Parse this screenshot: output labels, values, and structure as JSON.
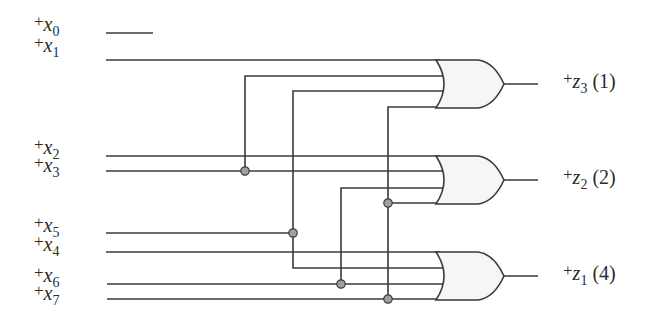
{
  "diagram": {
    "type": "logic-circuit",
    "colors": {
      "wire": "#3a3a3a",
      "gate_fill": "#f6f6f6",
      "dot_fill": "#a0a0a0",
      "text": "#2b2b2b"
    },
    "inputs": [
      {
        "id": "x0",
        "sign": "+",
        "var": "x",
        "sub": "0",
        "y": 33
      },
      {
        "id": "x1",
        "sign": "+",
        "var": "x",
        "sub": "1",
        "y": 60
      },
      {
        "id": "x2",
        "sign": "+",
        "var": "x",
        "sub": "2",
        "y": 156
      },
      {
        "id": "x3",
        "sign": "+",
        "var": "x",
        "sub": "3",
        "y": 171
      },
      {
        "id": "x5",
        "sign": "+",
        "var": "x",
        "sub": "5",
        "y": 233
      },
      {
        "id": "x4",
        "sign": "+",
        "var": "x",
        "sub": "4",
        "y": 252
      },
      {
        "id": "x6",
        "sign": "+",
        "var": "x",
        "sub": "6",
        "y": 284
      },
      {
        "id": "x7",
        "sign": "+",
        "var": "x",
        "sub": "7",
        "y": 299
      }
    ],
    "outputs": [
      {
        "id": "z3",
        "sign": "+",
        "var": "z",
        "sub": "3",
        "weight": "(1)",
        "y": 84
      },
      {
        "id": "z2",
        "sign": "+",
        "var": "z",
        "sub": "2",
        "weight": "(2)",
        "y": 180
      },
      {
        "id": "z1",
        "sign": "+",
        "var": "z",
        "sub": "1",
        "weight": "(4)",
        "y": 276
      }
    ],
    "gates": [
      {
        "id": "or-top",
        "type": "OR",
        "inputs": [
          "x1",
          "x3",
          "x5",
          "x7"
        ],
        "output": "z3"
      },
      {
        "id": "or-middle",
        "type": "OR",
        "inputs": [
          "x2",
          "x3",
          "x6",
          "x7"
        ],
        "output": "z2"
      },
      {
        "id": "or-bottom",
        "type": "OR",
        "inputs": [
          "x4",
          "x5",
          "x6",
          "x7"
        ],
        "output": "z1"
      }
    ]
  }
}
